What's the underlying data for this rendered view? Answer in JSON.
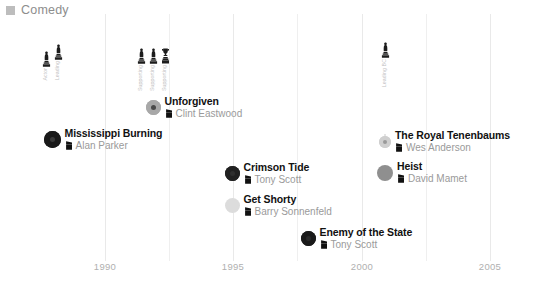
{
  "legend": {
    "swatch_color": "#bdbdbd",
    "label": "Comedy"
  },
  "axis": {
    "ticks": [
      {
        "label": "1990",
        "x": 105
      },
      {
        "label": "1995",
        "x": 233
      },
      {
        "label": "2000",
        "x": 362
      },
      {
        "label": "2005",
        "x": 490
      }
    ],
    "gridline_color": "#e9e9e9",
    "tick_label_color": "#b0b0b0"
  },
  "chart_data": {
    "type": "scatter",
    "title": "",
    "xlabel": "",
    "ylabel": "",
    "xlim": [
      1987,
      2006
    ],
    "grid": true,
    "legend_position": "top-left",
    "series_name": "Comedy",
    "points": [
      {
        "title": "Mississippi Burning",
        "director": "Alan Parker",
        "year": 1988,
        "x": 52,
        "y": 139,
        "marker_size": 17,
        "marker_color": "#1a1a1a",
        "marker_inner_color": "#3a3a3a",
        "stem_top": 44,
        "stem_height": 88,
        "awards": [
          {
            "icon": "oscar-statuette",
            "category": "Actor"
          },
          {
            "icon": "oscar-statuette",
            "category": "Leading"
          }
        ]
      },
      {
        "title": "Unforgiven",
        "director": "Clint Eastwood",
        "year": 1992,
        "x": 153,
        "y": 106,
        "marker_size": 15,
        "marker_color": "#a8a8a8",
        "marker_inner_color": "#4a4a4a",
        "stem_top": 48,
        "stem_height": 52,
        "awards": [
          {
            "icon": "oscar-statuette",
            "category": "Supporting"
          },
          {
            "icon": "oscar-statuette",
            "category": "Supporting"
          },
          {
            "icon": "oscar-trophy",
            "category": "Supporting"
          }
        ]
      },
      {
        "title": "Crimson Tide",
        "director": "Tony Scott",
        "year": 1995,
        "x": 232,
        "y": 172,
        "marker_size": 15,
        "marker_color": "#212121",
        "marker_inner_color": "#2f2f2f",
        "stem_top": 0,
        "stem_height": 0,
        "awards": []
      },
      {
        "title": "Get Shorty",
        "director": "Barry Sonnenfeld",
        "year": 1995,
        "x": 232,
        "y": 204,
        "marker_size": 15,
        "marker_color": "#dcdcdc",
        "marker_inner_color": "#dcdcdc",
        "stem_top": 0,
        "stem_height": 0,
        "awards": []
      },
      {
        "title": "Enemy of the State",
        "director": "Tony Scott",
        "year": 1998,
        "x": 308,
        "y": 237,
        "marker_size": 15,
        "marker_color": "#1a1a1a",
        "marker_inner_color": "#2a2a2a",
        "stem_top": 0,
        "stem_height": 0,
        "awards": []
      },
      {
        "title": "The Royal Tenenbaums",
        "director": "Wes Anderson",
        "year": 2001,
        "x": 385,
        "y": 139,
        "marker_size": 12,
        "marker_color": "#cfcfcf",
        "marker_inner_color": "#9a9a9a",
        "stem_top": 42,
        "stem_height": 92,
        "awards": [
          {
            "icon": "oscar-statuette",
            "category": "Leading BC"
          }
        ]
      },
      {
        "title": "Heist",
        "director": "David Mamet",
        "year": 2001,
        "x": 385,
        "y": 172,
        "marker_size": 16,
        "marker_color": "#8f8f8f",
        "marker_inner_color": "#8f8f8f",
        "stem_top": 0,
        "stem_height": 0,
        "awards": []
      }
    ]
  }
}
